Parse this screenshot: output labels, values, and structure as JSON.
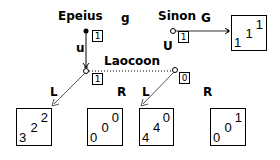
{
  "players": {
    "epeius": "Epeius",
    "sinon": "Sinon",
    "laocoon": "Laocoon"
  },
  "moves": {
    "epeius_label": "g",
    "epeius_edge": "u",
    "sinon_label": "G",
    "sinon_edge": "U",
    "laocoon_left_L": "L",
    "laocoon_left_R": "R",
    "laocoon_right_L": "L",
    "laocoon_right_R": "R"
  },
  "info_sets": {
    "epeius": "1",
    "sinon": "1",
    "laocoon_left": "1",
    "laocoon_right": "0"
  },
  "payoffs": {
    "sinon_G": {
      "top": "1",
      "mid": "1",
      "bot": "1"
    },
    "left_L": {
      "top": "2",
      "mid": "2",
      "bot": "3"
    },
    "left_R": {
      "top": "0",
      "mid": "0",
      "bot": "0"
    },
    "right_L": {
      "top": "0",
      "mid": "4",
      "bot": "4"
    },
    "right_R": {
      "top": "1",
      "mid": "0",
      "bot": "0"
    }
  }
}
